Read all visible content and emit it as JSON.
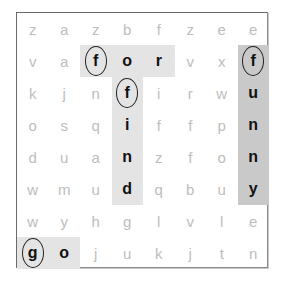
{
  "puzzle": {
    "rows": 8,
    "cols": 8,
    "grid": [
      [
        "z",
        "a",
        "z",
        "b",
        "f",
        "z",
        "e",
        "e"
      ],
      [
        "v",
        "a",
        "f",
        "o",
        "r",
        "v",
        "x",
        "f"
      ],
      [
        "k",
        "j",
        "n",
        "f",
        "i",
        "r",
        "w",
        "u"
      ],
      [
        "o",
        "s",
        "q",
        "i",
        "f",
        "f",
        "p",
        "n"
      ],
      [
        "d",
        "u",
        "a",
        "n",
        "z",
        "f",
        "o",
        "n"
      ],
      [
        "w",
        "m",
        "u",
        "d",
        "q",
        "b",
        "u",
        "y"
      ],
      [
        "w",
        "y",
        "h",
        "g",
        "l",
        "v",
        "l",
        "e"
      ],
      [
        "g",
        "o",
        "j",
        "u",
        "k",
        "j",
        "t",
        "n"
      ]
    ],
    "found_words": [
      {
        "word": "for",
        "start": [
          1,
          2
        ],
        "direction": "right",
        "length": 3,
        "color": "#e4e4e4"
      },
      {
        "word": "find",
        "start": [
          2,
          3
        ],
        "direction": "down",
        "length": 4,
        "color": "#e4e4e4"
      },
      {
        "word": "funny",
        "start": [
          1,
          7
        ],
        "direction": "down",
        "length": 5,
        "color": "#c9c9c9"
      },
      {
        "word": "go",
        "start": [
          7,
          0
        ],
        "direction": "right",
        "length": 2,
        "color": "#e4e4e4"
      }
    ],
    "circled_cells": [
      [
        1,
        2
      ],
      [
        2,
        3
      ],
      [
        1,
        7
      ],
      [
        7,
        0
      ]
    ],
    "colors": {
      "letter_dim": "#bdbdbd",
      "letter_found": "#111111",
      "shade_light": "#e4e4e4",
      "shade_dark": "#c9c9c9",
      "border": "#6a6a6a"
    }
  }
}
